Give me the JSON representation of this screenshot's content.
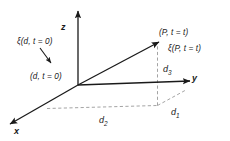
{
  "figure": {
    "type": "3d-coordinate-diagram",
    "background_color": "#ffffff",
    "line_color": "#1a1a1a",
    "dashed_color": "#9a9a9a",
    "axes": {
      "z_label": "z",
      "y_label": "y",
      "x_label": "x"
    },
    "labels": {
      "xi_d_t0": "ξ(d, t = 0)",
      "d_t0": "(d, t = 0)",
      "p_t_t": "(P, t = t)",
      "xi_p_t_t": "ξ(P, t = t)",
      "d1": "d",
      "d1_sub": "1",
      "d2": "d",
      "d2_sub": "2",
      "d3": "d",
      "d3_sub": "3"
    }
  }
}
